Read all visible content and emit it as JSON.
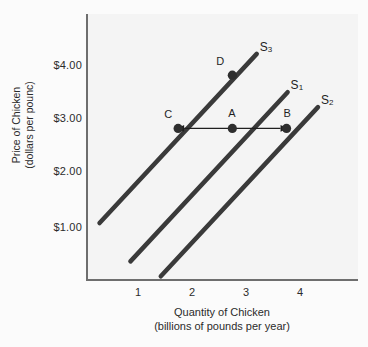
{
  "chart_data": {
    "type": "line",
    "title": "",
    "xlabel": "Quantity of Chicken",
    "xlabel_sub": "(billions of pounds per year)",
    "ylabel": "Price of Chicken",
    "ylabel_sub": "(dollars per pounc)",
    "xlim": [
      0.2,
      5.0
    ],
    "ylim": [
      0.15,
      4.9
    ],
    "xticks": [
      1,
      2,
      3,
      4
    ],
    "xtick_labels": [
      "1",
      "2",
      "3",
      "4"
    ],
    "yticks": [
      1.0,
      2.0,
      3.0,
      4.0
    ],
    "ytick_labels": [
      "$1.00",
      "$2.00",
      "$3.00",
      "$4.00"
    ],
    "grid": false,
    "legend_position": "inline-curve-end",
    "curve_color": "#3a3a3a",
    "text_color": "#2b2b2b",
    "panel_color": "#f4f4f4",
    "series": [
      {
        "name": "S3",
        "label": "S",
        "subscript": "3",
        "x": [
          0.55,
          3.45
        ],
        "y": [
          1.22,
          4.4
        ]
      },
      {
        "name": "S1",
        "label": "S",
        "subscript": "1",
        "x": [
          1.12,
          4.02
        ],
        "y": [
          0.5,
          3.68
        ]
      },
      {
        "name": "S2",
        "label": "S",
        "subscript": "2",
        "x": [
          1.68,
          4.58
        ],
        "y": [
          0.22,
          3.4
        ]
      }
    ],
    "points": [
      {
        "name": "C",
        "label": "C",
        "x": 2.0,
        "y": 3.0,
        "on_curve": "S3"
      },
      {
        "name": "A",
        "label": "A",
        "x": 3.0,
        "y": 3.0,
        "on_curve": "S1"
      },
      {
        "name": "B",
        "label": "B",
        "x": 4.0,
        "y": 3.0,
        "on_curve": "S2"
      },
      {
        "name": "D",
        "label": "D",
        "x": 3.0,
        "y": 4.0,
        "on_curve": "S3"
      }
    ],
    "annotations": [
      {
        "name": "shift-arrow",
        "type": "double-headed-arrow",
        "from_x": 2.0,
        "to_x": 4.0,
        "y": 3.0,
        "text": ""
      }
    ]
  },
  "axes": {
    "y_title_line1": "Price of Chicken",
    "y_title_line2": "(dollars per pounc)",
    "x_title_line1": "Quantity of Chicken",
    "x_title_line2": "(billions of pounds per year)"
  }
}
